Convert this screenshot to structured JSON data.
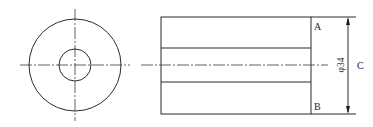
{
  "figure": {
    "end_view": {
      "shapes": [
        "outer-circle",
        "inner-bore-circle",
        "horizontal-centerline",
        "vertical-centerline"
      ]
    },
    "side_view": {
      "shapes": [
        "outline-rectangle",
        "bore-top-line",
        "bore-bottom-line",
        "axis-centerline"
      ],
      "labels": {
        "top_face": "A",
        "bottom_face": "B",
        "side": "C"
      },
      "dimension": {
        "text": "φ34",
        "quantity": "outer diameter",
        "value": 34
      }
    }
  }
}
